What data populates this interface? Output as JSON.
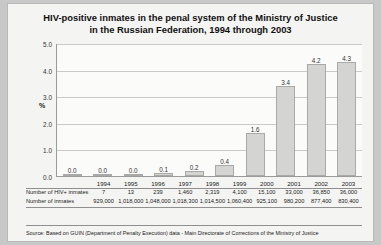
{
  "chart_data": {
    "type": "bar",
    "title": "HIV-positive inmates in the penal system of the Ministry of Justice in the Russian Federation, 1994 through 2003",
    "title_line1": "HIV-positive inmates in the penal system of the Ministry of Justice",
    "title_line2": "in the Russian Federation, 1994 through 2003",
    "categories": [
      "1994",
      "1995",
      "1996",
      "1997",
      "1998",
      "1999",
      "2000",
      "2001",
      "2002",
      "2003"
    ],
    "values": [
      0.0,
      0.0,
      0.0,
      0.1,
      0.2,
      0.4,
      1.6,
      3.4,
      4.2,
      4.3
    ],
    "value_labels": [
      "0.0",
      "0.0",
      "0.0",
      "0.1",
      "0.2",
      "0.4",
      "1.6",
      "3.4",
      "4.2",
      "4.3"
    ],
    "xlabel": "",
    "ylabel": "%",
    "ylim": [
      0.0,
      5.0
    ],
    "yticks": [
      0.0,
      1.0,
      2.0,
      3.0,
      4.0,
      5.0
    ],
    "ytick_labels": [
      "0.0",
      "1.0",
      "2.0",
      "3.0",
      "4.0",
      "5.0"
    ],
    "grid": true,
    "legend": "none",
    "bar_color": "#d4d4d2",
    "bar_border_color": "#a9a9a7"
  },
  "table": {
    "rows": [
      {
        "label": "Number of HIV+ inmates",
        "values": [
          "7",
          "13",
          "239",
          "1,460",
          "2,319",
          "4,100",
          "15,100",
          "33,000",
          "36,850",
          "36,000"
        ]
      },
      {
        "label": "Number of inmates",
        "values": [
          "929,000",
          "1,018,000",
          "1,048,000",
          "1,018,300",
          "1,014,500",
          "1,060,400",
          "925,100",
          "980,200",
          "877,400",
          "830,400"
        ]
      }
    ]
  },
  "source": {
    "text": "Source: Based on GUIN (Department of Penalty Execution) data - Main Directorate of Corrections of the Ministry of Justice"
  }
}
